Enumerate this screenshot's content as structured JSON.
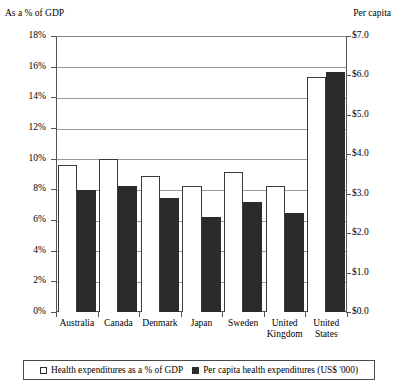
{
  "chart_data": {
    "type": "bar",
    "title": "",
    "categories": [
      "Australia",
      "Canada",
      "Denmark",
      "Japan",
      "Sweden",
      "United Kingdom",
      "United States"
    ],
    "series": [
      {
        "name": "Health expenditures as a % of GDP",
        "axis": "left",
        "unit": "%",
        "style": "open",
        "values": [
          9.6,
          10.0,
          8.9,
          8.2,
          9.1,
          8.2,
          15.3
        ]
      },
      {
        "name": "Per capita health expenditures (US$ '000)",
        "axis": "right",
        "unit": "US$ '000",
        "style": "filled",
        "values": [
          3.1,
          3.2,
          2.9,
          2.4,
          2.8,
          2.5,
          6.1
        ]
      }
    ],
    "left_axis": {
      "label": "As a % of GDP",
      "ticks": [
        "0%",
        "2%",
        "4%",
        "6%",
        "8%",
        "10%",
        "12%",
        "14%",
        "16%",
        "18%"
      ],
      "min": 0,
      "max": 18,
      "step": 2
    },
    "right_axis": {
      "label": "Per capita",
      "ticks": [
        "$0.0",
        "$1.0",
        "$2.0",
        "$3.0",
        "$4.0",
        "$5.0",
        "$6.0",
        "$7.0"
      ],
      "min": 0,
      "max": 7,
      "step": 1
    },
    "grid": true,
    "legend_position": "bottom",
    "colors": {
      "open_bar_fill": "#ffffff",
      "open_bar_stroke": "#3a3a3a",
      "filled_bar": "#2b2b2b",
      "axis": "#555555",
      "gridline": "#9a9a9a",
      "background": "#ffffff"
    }
  },
  "legend": {
    "entries": [
      {
        "label": "Health expenditures as a % of GDP",
        "swatch": "open-square-icon"
      },
      {
        "label": "Per capita health expenditures (US$ '000)",
        "swatch": "filled-square-icon"
      }
    ]
  }
}
